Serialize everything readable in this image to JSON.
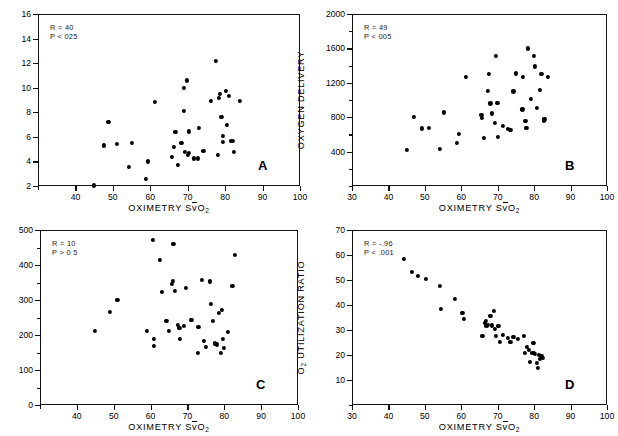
{
  "figure": {
    "panel_count": 4,
    "shared_xlabel_prefix": "OXIMETRY S",
    "shared_xlabel_vbar": "v",
    "shared_xlabel_suffix": "O",
    "shared_xlabel_sub": "2"
  },
  "chart_data": [
    {
      "type": "scatter",
      "panel": "A",
      "title": "",
      "xlabel": "OXIMETRY SvO2",
      "ylabel": "CARDIAC OUTPUT",
      "xlim": [
        30,
        100
      ],
      "ylim": [
        2,
        16
      ],
      "xticks": [
        30,
        40,
        50,
        60,
        70,
        80,
        90,
        100
      ],
      "xtick_labels": [
        "",
        "40",
        "50",
        "60",
        "70",
        "80",
        "90",
        "100"
      ],
      "yticks": [
        2,
        4,
        6,
        8,
        10,
        12,
        14,
        16
      ],
      "ytick_labels": [
        "2",
        "4",
        "6",
        "8",
        "10",
        "12",
        "14",
        "16"
      ],
      "grid": false,
      "annotations": {
        "r": "R = 40",
        "p": "P < 025"
      },
      "points": [
        [
          45.0,
          2.05
        ],
        [
          47.5,
          5.3
        ],
        [
          48.8,
          7.2
        ],
        [
          51.0,
          5.4
        ],
        [
          54.3,
          3.55
        ],
        [
          55.0,
          5.5
        ],
        [
          58.8,
          2.55
        ],
        [
          59.3,
          4.0
        ],
        [
          61.2,
          8.85
        ],
        [
          65.8,
          4.35
        ],
        [
          66.3,
          5.15
        ],
        [
          66.7,
          6.4
        ],
        [
          67.4,
          3.7
        ],
        [
          68.3,
          5.5
        ],
        [
          68.9,
          10.0
        ],
        [
          69.0,
          8.1
        ],
        [
          69.3,
          4.8
        ],
        [
          69.7,
          10.6
        ],
        [
          70.0,
          4.55
        ],
        [
          70.3,
          4.7
        ],
        [
          70.4,
          6.45
        ],
        [
          71.6,
          4.25
        ],
        [
          72.8,
          4.25
        ],
        [
          73.0,
          6.7
        ],
        [
          74.2,
          4.85
        ],
        [
          76.2,
          8.9
        ],
        [
          77.5,
          12.15
        ],
        [
          78.0,
          4.5
        ],
        [
          78.3,
          9.15
        ],
        [
          78.6,
          9.5
        ],
        [
          79.0,
          7.6
        ],
        [
          79.4,
          6.1
        ],
        [
          79.5,
          5.6
        ],
        [
          80.3,
          9.75
        ],
        [
          80.5,
          6.95
        ],
        [
          81.0,
          9.35
        ],
        [
          81.6,
          5.7
        ],
        [
          82.0,
          5.65
        ],
        [
          82.4,
          4.75
        ],
        [
          83.9,
          8.95
        ]
      ]
    },
    {
      "type": "scatter",
      "panel": "B",
      "title": "",
      "xlabel": "OXIMETRY SvO2",
      "ylabel": "OXYGEN DELIVERY",
      "xlim": [
        30,
        100
      ],
      "ylim": [
        0,
        2000
      ],
      "xticks": [
        30,
        40,
        50,
        60,
        70,
        80,
        90,
        100
      ],
      "xtick_labels": [
        "30",
        "40",
        "50",
        "60",
        "70",
        "80",
        "90",
        "100"
      ],
      "yticks": [
        0,
        200,
        400,
        600,
        800,
        1000,
        1200,
        1400,
        1600,
        1800,
        2000
      ],
      "ytick_labels": [
        "",
        "",
        "400",
        "",
        "800",
        "",
        "1200",
        "",
        "1600",
        "",
        "2000"
      ],
      "grid": false,
      "annotations": {
        "r": "R = 49",
        "p": "P < 005"
      },
      "points": [
        [
          45.0,
          415
        ],
        [
          47.0,
          805
        ],
        [
          49.2,
          670
        ],
        [
          51.0,
          675
        ],
        [
          54.2,
          435
        ],
        [
          55.3,
          855
        ],
        [
          58.8,
          500
        ],
        [
          59.3,
          610
        ],
        [
          61.2,
          1265
        ],
        [
          65.5,
          830
        ],
        [
          65.6,
          790
        ],
        [
          66.3,
          560
        ],
        [
          67.2,
          1110
        ],
        [
          67.5,
          1305
        ],
        [
          68.0,
          960
        ],
        [
          68.3,
          845
        ],
        [
          69.3,
          735
        ],
        [
          69.6,
          1510
        ],
        [
          69.9,
          965
        ],
        [
          70.1,
          575
        ],
        [
          71.5,
          700
        ],
        [
          72.9,
          660
        ],
        [
          73.5,
          655
        ],
        [
          74.3,
          1100
        ],
        [
          75.0,
          1310
        ],
        [
          76.8,
          890
        ],
        [
          77.0,
          1270
        ],
        [
          77.6,
          755
        ],
        [
          77.9,
          680
        ],
        [
          78.2,
          1600
        ],
        [
          79.0,
          1015
        ],
        [
          80.0,
          1510
        ],
        [
          80.3,
          1390
        ],
        [
          80.8,
          905
        ],
        [
          81.5,
          1120
        ],
        [
          82.0,
          1305
        ],
        [
          82.6,
          760
        ],
        [
          82.8,
          775
        ],
        [
          83.8,
          1265
        ]
      ]
    },
    {
      "type": "scatter",
      "panel": "C",
      "title": "",
      "xlabel": "OXIMETRY SvO2",
      "ylabel": "OXYGEN CONSUMPTION",
      "xlim": [
        30,
        100
      ],
      "ylim": [
        0,
        500
      ],
      "xticks": [
        30,
        40,
        50,
        60,
        70,
        80,
        90,
        100
      ],
      "xtick_labels": [
        "",
        "40",
        "50",
        "60",
        "70",
        "80",
        "90",
        "100"
      ],
      "yticks": [
        0,
        50,
        100,
        150,
        200,
        250,
        300,
        350,
        400,
        450,
        500
      ],
      "ytick_labels": [
        "0",
        "",
        "100",
        "",
        "200",
        "",
        "300",
        "",
        "400",
        "",
        "500"
      ],
      "grid": false,
      "annotations": {
        "r": "R = 10",
        "p": "P > 0 5"
      },
      "points": [
        [
          45.0,
          211
        ],
        [
          49.0,
          267
        ],
        [
          51.0,
          301
        ],
        [
          59.0,
          212
        ],
        [
          60.6,
          471
        ],
        [
          60.8,
          188
        ],
        [
          61.0,
          168
        ],
        [
          62.5,
          415
        ],
        [
          63.0,
          322
        ],
        [
          64.3,
          240
        ],
        [
          65.0,
          212
        ],
        [
          65.8,
          345
        ],
        [
          66.0,
          355
        ],
        [
          66.2,
          460
        ],
        [
          66.5,
          325
        ],
        [
          67.5,
          228
        ],
        [
          67.8,
          221
        ],
        [
          68.0,
          190
        ],
        [
          69.0,
          225
        ],
        [
          69.5,
          335
        ],
        [
          71.0,
          242
        ],
        [
          71.3,
          243
        ],
        [
          72.8,
          148
        ],
        [
          73.0,
          224
        ],
        [
          74.0,
          357
        ],
        [
          74.5,
          182
        ],
        [
          75.0,
          165
        ],
        [
          76.0,
          353
        ],
        [
          76.3,
          290
        ],
        [
          77.0,
          241
        ],
        [
          77.5,
          176
        ],
        [
          78.0,
          173
        ],
        [
          78.5,
          263
        ],
        [
          79.0,
          149
        ],
        [
          79.3,
          271
        ],
        [
          79.6,
          188
        ],
        [
          80.0,
          163
        ],
        [
          81.0,
          210
        ],
        [
          82.2,
          340
        ],
        [
          82.8,
          430
        ]
      ]
    },
    {
      "type": "scatter",
      "panel": "D",
      "title": "",
      "xlabel": "OXIMETRY SvO2",
      "ylabel": "O2 UTILIZATION RATIO",
      "xlim": [
        30,
        100
      ],
      "ylim": [
        0,
        70
      ],
      "xticks": [
        30,
        40,
        50,
        60,
        70,
        80,
        90,
        100
      ],
      "xtick_labels": [
        "30",
        "40",
        "50",
        "60",
        "70",
        "80",
        "90",
        "100"
      ],
      "yticks": [
        0,
        10,
        20,
        30,
        40,
        50,
        60,
        70
      ],
      "ytick_labels": [
        "",
        "10",
        "20",
        "30",
        "40",
        "50",
        "60",
        "70"
      ],
      "grid": false,
      "annotations": {
        "r": "R = -.96",
        "p": "P < .001"
      },
      "points": [
        [
          44.3,
          58.5
        ],
        [
          46.5,
          53.3
        ],
        [
          48.2,
          51.8
        ],
        [
          50.2,
          50.5
        ],
        [
          54.2,
          47.6
        ],
        [
          54.5,
          38.3
        ],
        [
          58.3,
          42.3
        ],
        [
          60.3,
          37.0
        ],
        [
          60.8,
          34.5
        ],
        [
          65.8,
          27.8
        ],
        [
          66.5,
          32.8
        ],
        [
          66.8,
          33.5
        ],
        [
          66.9,
          31.8
        ],
        [
          67.3,
          32.2
        ],
        [
          68.0,
          35.5
        ],
        [
          68.3,
          32.0
        ],
        [
          68.5,
          31.5
        ],
        [
          69.0,
          37.5
        ],
        [
          69.3,
          30.5
        ],
        [
          69.5,
          27.5
        ],
        [
          70.0,
          31.8
        ],
        [
          70.3,
          31.5
        ],
        [
          70.5,
          25.2
        ],
        [
          71.5,
          28.0
        ],
        [
          72.8,
          26.8
        ],
        [
          73.5,
          25.2
        ],
        [
          74.3,
          27.3
        ],
        [
          75.5,
          26.5
        ],
        [
          77.3,
          27.8
        ],
        [
          77.5,
          21.0
        ],
        [
          78.0,
          23.2
        ],
        [
          78.5,
          22.0
        ],
        [
          78.8,
          17.3
        ],
        [
          79.3,
          20.8
        ],
        [
          79.8,
          24.8
        ],
        [
          80.0,
          21.0
        ],
        [
          80.3,
          20.5
        ],
        [
          80.8,
          16.8
        ],
        [
          81.0,
          14.8
        ],
        [
          81.3,
          20.0
        ],
        [
          81.6,
          18.5
        ],
        [
          82.0,
          19.5
        ],
        [
          82.3,
          18.8
        ]
      ]
    }
  ]
}
